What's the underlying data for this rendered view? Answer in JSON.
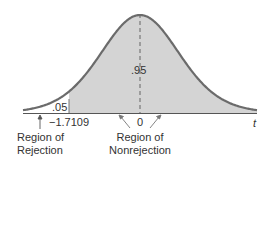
{
  "chart_data": {
    "type": "area",
    "title": "",
    "distribution": "t",
    "xlabel": "t",
    "ylabel": "",
    "tick_labels": [
      "-1.7109",
      "0"
    ],
    "critical_value": -1.7109,
    "tail": "left",
    "regions": [
      {
        "name": "Region of Rejection",
        "area": 0.05,
        "x_range": [
          "-inf",
          -1.7109
        ],
        "fill": "#ffffff"
      },
      {
        "name": "Region of Nonrejection",
        "area": 0.95,
        "x_range": [
          -1.7109,
          "inf"
        ],
        "fill": "#d4d4d4"
      }
    ],
    "annotations": [
      ".05",
      ".95"
    ],
    "grid": false,
    "legend": "none"
  },
  "labels": {
    "alpha": ".05",
    "confidence": ".95",
    "critical": "−1.7109",
    "zero": "0",
    "axis_var": "t",
    "rejection_line1": "Region of",
    "rejection_line2": "Rejection",
    "nonrejection_line1": "Region of",
    "nonrejection_line2": "Nonrejection"
  },
  "colors": {
    "curve": "#6b6b6b",
    "fill": "#d4d4d4",
    "axis": "#555555"
  }
}
